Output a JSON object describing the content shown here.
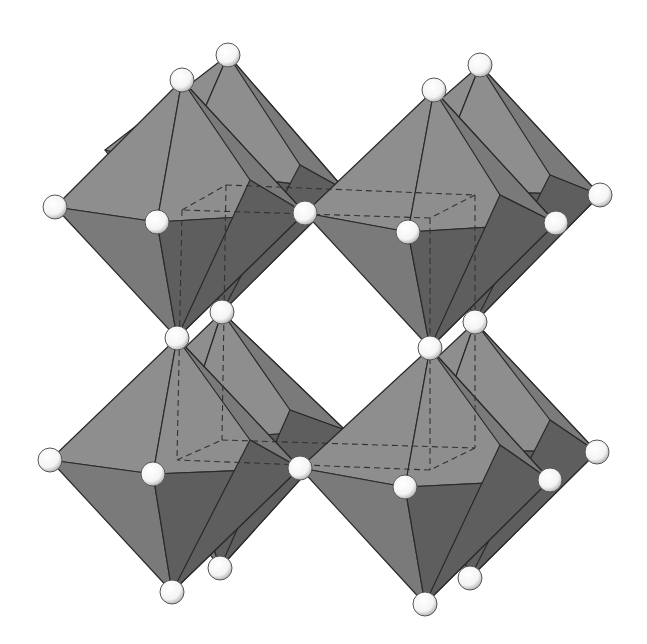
{
  "diagram": {
    "type": "crystal-structure",
    "colors": {
      "background": "#ffffff",
      "face_light": "#8e8e8e",
      "face_mid": "#7a7a7a",
      "face_dark": "#5e5e5e",
      "edge": "#2a2a2a",
      "atom_fill": "#f4f4f4",
      "atom_stroke": "#555555",
      "dashed_line": "#333333"
    },
    "octahedra": [
      {
        "id": "back-top-left",
        "top": [
          228,
          55
        ],
        "left": [
          105,
          150
        ],
        "right": [
          345,
          190
        ],
        "front": [
          178,
          170
        ],
        "back": [
          300,
          165
        ],
        "bottom": [
          222,
          312
        ]
      },
      {
        "id": "front-top-left",
        "top": [
          182,
          80
        ],
        "left": [
          55,
          207
        ],
        "right": [
          305,
          213
        ],
        "front": [
          157,
          222
        ],
        "back": [
          250,
          180
        ],
        "bottom": [
          177,
          338
        ]
      },
      {
        "id": "back-top-right",
        "top": [
          480,
          65
        ],
        "left": [
          360,
          170
        ],
        "right": [
          600,
          195
        ],
        "front": [
          430,
          190
        ],
        "back": [
          550,
          175
        ],
        "bottom": [
          475,
          322
        ]
      },
      {
        "id": "front-top-right",
        "top": [
          434,
          90
        ],
        "left": [
          305,
          213
        ],
        "right": [
          556,
          223
        ],
        "front": [
          408,
          232
        ],
        "back": [
          500,
          195
        ],
        "bottom": [
          430,
          348
        ]
      },
      {
        "id": "back-bottom-left",
        "top": [
          222,
          312
        ],
        "left": [
          110,
          420
        ],
        "right": [
          345,
          430
        ],
        "front": [
          180,
          440
        ],
        "back": [
          290,
          410
        ],
        "bottom": [
          220,
          568
        ]
      },
      {
        "id": "front-bottom-left",
        "top": [
          177,
          338
        ],
        "left": [
          50,
          460
        ],
        "right": [
          300,
          468
        ],
        "front": [
          153,
          474
        ],
        "back": [
          250,
          440
        ],
        "bottom": [
          172,
          592
        ]
      },
      {
        "id": "back-bottom-right",
        "top": [
          475,
          322
        ],
        "left": [
          360,
          430
        ],
        "right": [
          597,
          452
        ],
        "front": [
          430,
          450
        ],
        "back": [
          550,
          420
        ],
        "bottom": [
          470,
          578
        ]
      },
      {
        "id": "front-bottom-right",
        "top": [
          430,
          348
        ],
        "left": [
          300,
          468
        ],
        "right": [
          550,
          480
        ],
        "front": [
          405,
          487
        ],
        "back": [
          500,
          445
        ],
        "bottom": [
          425,
          604
        ]
      }
    ],
    "atoms": [
      [
        228,
        55
      ],
      [
        182,
        80
      ],
      [
        480,
        65
      ],
      [
        434,
        90
      ],
      [
        55,
        207
      ],
      [
        157,
        222
      ],
      [
        305,
        213
      ],
      [
        408,
        232
      ],
      [
        556,
        223
      ],
      [
        600,
        195
      ],
      [
        222,
        312
      ],
      [
        177,
        338
      ],
      [
        475,
        322
      ],
      [
        430,
        348
      ],
      [
        50,
        460
      ],
      [
        153,
        474
      ],
      [
        300,
        468
      ],
      [
        405,
        487
      ],
      [
        550,
        480
      ],
      [
        597,
        452
      ],
      [
        220,
        568
      ],
      [
        172,
        592
      ],
      [
        470,
        578
      ],
      [
        425,
        604
      ]
    ],
    "unit_cell_dashed": [
      [
        [
          182,
          210
        ],
        [
          226,
          185
        ]
      ],
      [
        [
          226,
          185
        ],
        [
          475,
          195
        ]
      ],
      [
        [
          475,
          195
        ],
        [
          430,
          218
        ]
      ],
      [
        [
          430,
          218
        ],
        [
          182,
          210
        ]
      ],
      [
        [
          182,
          210
        ],
        [
          177,
          460
        ]
      ],
      [
        [
          226,
          185
        ],
        [
          222,
          440
        ]
      ],
      [
        [
          430,
          218
        ],
        [
          430,
          470
        ]
      ],
      [
        [
          475,
          195
        ],
        [
          475,
          448
        ]
      ],
      [
        [
          177,
          460
        ],
        [
          222,
          440
        ]
      ],
      [
        [
          222,
          440
        ],
        [
          475,
          448
        ]
      ],
      [
        [
          475,
          448
        ],
        [
          430,
          470
        ]
      ],
      [
        [
          430,
          470
        ],
        [
          177,
          460
        ]
      ]
    ]
  }
}
